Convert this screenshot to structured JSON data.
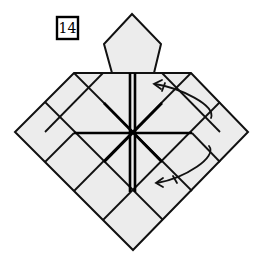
{
  "diagram": {
    "step_number": "14",
    "colors": {
      "paper": "#ececec",
      "line": "#111111",
      "background": "#ffffff"
    },
    "shapes": {
      "pentagon": "132,14 161,44 154,73 112,73 104,44",
      "base": "74,73 191,73 248,132 133,250 15,132"
    },
    "creases": [
      {
        "x1": 74,
        "y1": 73,
        "x2": 192,
        "y2": 191
      },
      {
        "x1": 191,
        "y1": 73,
        "x2": 74,
        "y2": 191
      },
      {
        "x1": 45,
        "y1": 102,
        "x2": 163,
        "y2": 220
      },
      {
        "x1": 220,
        "y1": 102,
        "x2": 103,
        "y2": 220
      },
      {
        "x1": 103,
        "y1": 73,
        "x2": 45,
        "y2": 132
      },
      {
        "x1": 162,
        "y1": 73,
        "x2": 220,
        "y2": 132
      },
      {
        "x1": 74,
        "y1": 133,
        "x2": 45,
        "y2": 162
      },
      {
        "x1": 192,
        "y1": 133,
        "x2": 220,
        "y2": 162
      }
    ],
    "bold_lines": [
      {
        "x1": 130,
        "y1": 73,
        "x2": 130,
        "y2": 192
      },
      {
        "x1": 135,
        "y1": 73,
        "x2": 135,
        "y2": 192
      },
      {
        "x1": 74,
        "y1": 133,
        "x2": 192,
        "y2": 133
      },
      {
        "x1": 104,
        "y1": 103,
        "x2": 162,
        "y2": 162
      },
      {
        "x1": 162,
        "y1": 103,
        "x2": 104,
        "y2": 162
      }
    ],
    "arrows": [
      {
        "name": "fold-arrow-upper",
        "d": "M 211 118 C 216 105, 180 88, 155 84",
        "head": "M 162 80 L 154 84 L 161 89",
        "tick": "M 165 83 L 162 91"
      },
      {
        "name": "fold-arrow-lower",
        "d": "M 209 146 C 218 157, 185 178, 157 183",
        "head": "M 163 178 L 156 183 L 163 187",
        "tick": "M 173 176 L 177 183"
      }
    ]
  }
}
